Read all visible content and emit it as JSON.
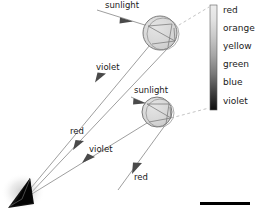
{
  "figure": {
    "background_color": "#ffffff",
    "ray_color": "#8c8c8c",
    "arrow_color": "#555555",
    "drop_fill": "#d9d9d9",
    "drop_stroke": "#6e6e6e",
    "dash_color": "#b8b8b8",
    "observer_color": "#111111"
  },
  "labels": {
    "sunlight_upper": "sunlight",
    "sunlight_lower": "sunlight",
    "violet_upper": "violet",
    "red_middle": "red",
    "violet_lower": "violet",
    "red_lower": "red"
  },
  "spectrum": {
    "orientation": "vertical",
    "top_color": "#e8e8e8",
    "bottom_color": "#101010",
    "entries": [
      {
        "name": "red",
        "color": "#e8e8e8",
        "y": 13
      },
      {
        "name": "orange",
        "color": "#d2d2d2",
        "y": 31
      },
      {
        "name": "yellow",
        "color": "#b4b4b4",
        "y": 49
      },
      {
        "name": "green",
        "color": "#8a8a8a",
        "y": 67
      },
      {
        "name": "blue",
        "color": "#4e4e4e",
        "y": 85
      },
      {
        "name": "violet",
        "color": "#181818",
        "y": 104
      }
    ]
  },
  "drops": [
    {
      "id": "upper-raindrop",
      "cx": 160,
      "cy": 33,
      "r": 17
    },
    {
      "id": "lower-raindrop",
      "cx": 157,
      "cy": 112,
      "r": 15
    }
  ],
  "observer": {
    "id": "observer-eye",
    "x": 22,
    "y": 192
  },
  "footer_bar": {
    "x": 200,
    "y": 202,
    "width": 50,
    "height": 3,
    "color": "#000000"
  }
}
